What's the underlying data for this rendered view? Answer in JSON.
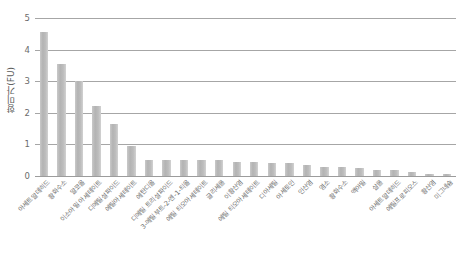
{
  "chart_data": {
    "type": "bar",
    "title": "",
    "xlabel": "",
    "ylabel": "향미가(FU)",
    "ylim": [
      0,
      5
    ],
    "ytick_labels": [
      "0",
      "1",
      "2",
      "3",
      "4",
      "5"
    ],
    "ytick_values": [
      0,
      1,
      2,
      3,
      4,
      5
    ],
    "grid": true,
    "legend": false,
    "bar_color": "#bdbdbd",
    "gridline_color": "#a6a6a6",
    "categories": [
      "아세트알데히드",
      "황화수소",
      "알코올",
      "이소아밀 아세테이트",
      "디메틸설파이드",
      "에틸아세테이트",
      "에탄디올",
      "디메틸 트리설파이드",
      "3-메틸부트-2-엔-1-티올",
      "에틸 티오아세테이트",
      "글리세롤",
      "이황산염",
      "에틸 티오아세테이트",
      "디아세틸",
      "아세토인",
      "인산염",
      "염소",
      "황화수소",
      "액아밀",
      "살롤",
      "아세트알데히드",
      "에틸프로피오스",
      "황산염",
      "미그네슘"
    ],
    "values": [
      4.55,
      3.55,
      3.0,
      2.2,
      1.65,
      0.95,
      0.5,
      0.5,
      0.5,
      0.5,
      0.5,
      0.45,
      0.45,
      0.4,
      0.4,
      0.35,
      0.3,
      0.3,
      0.25,
      0.2,
      0.18,
      0.12,
      0.07,
      0.05
    ]
  }
}
